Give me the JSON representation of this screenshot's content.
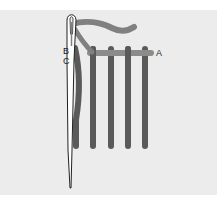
{
  "diagram": {
    "type": "stitching-illustration",
    "labels": {
      "a": "A",
      "b": "B",
      "c": "C"
    },
    "colors": {
      "background": "#ececec",
      "vertical_stitches": "#5a5a5a",
      "horizontal_thread": "#8c8c8c",
      "working_thread": "#808080",
      "needle_outline": "#222222",
      "needle_fill": "#ffffff"
    },
    "vertical_stitch_count": 4
  }
}
